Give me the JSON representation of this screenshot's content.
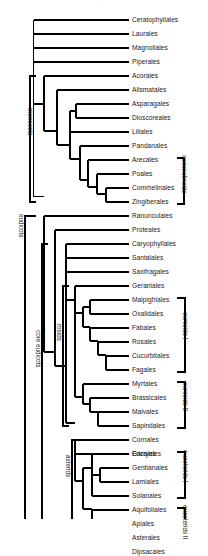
{
  "figure": {
    "type": "cladogram",
    "top_partial_caption": "· · · ·"
  },
  "tips": [
    {
      "name": "Ceratophyllales"
    },
    {
      "name": "Laurales"
    },
    {
      "name": "Magnoliales"
    },
    {
      "name": "Piperales"
    },
    {
      "name": "Acorales"
    },
    {
      "name": "Alismatales"
    },
    {
      "name": "Asparagales"
    },
    {
      "name": "Dioscoreales"
    },
    {
      "name": "Liliales"
    },
    {
      "name": "Pandanales"
    },
    {
      "name": "Arecales"
    },
    {
      "name": "Poales"
    },
    {
      "name": "Commelinales"
    },
    {
      "name": "Zingiberales"
    },
    {
      "name": "Ranunculales"
    },
    {
      "name": "Proteales"
    },
    {
      "name": "Caryophyllales"
    },
    {
      "name": "Santalales"
    },
    {
      "name": "Saxifragales"
    },
    {
      "name": "Geraniales"
    },
    {
      "name": "Malpighiales"
    },
    {
      "name": "Oxalidales"
    },
    {
      "name": "Fabales"
    },
    {
      "name": "Rosales"
    },
    {
      "name": "Cucurbitales"
    },
    {
      "name": "Fagales"
    },
    {
      "name": "Myrtales"
    },
    {
      "name": "Brassicales"
    },
    {
      "name": "Malvales"
    },
    {
      "name": "Sapindales"
    },
    {
      "name": "Cornales"
    },
    {
      "name": "Ericales"
    },
    {
      "name": "Garryales"
    },
    {
      "name": "Gentianales"
    },
    {
      "name": "Lamiales"
    },
    {
      "name": "Solanales"
    },
    {
      "name": "Aquifoliales"
    },
    {
      "name": "Apiales"
    },
    {
      "name": "Asterales"
    },
    {
      "name": "Dipsacales"
    }
  ],
  "clade_labels_left": [
    {
      "name": "monocots"
    },
    {
      "name": "eudicots"
    },
    {
      "name": "core eudicots"
    },
    {
      "name": "rosids"
    },
    {
      "name": "asterids"
    }
  ],
  "brackets_right": [
    {
      "name": "commelinoids"
    },
    {
      "name": "eurosids I"
    },
    {
      "name": "eurosids II"
    },
    {
      "name": "euasterids I"
    },
    {
      "name": "euasterids II"
    }
  ],
  "colors": {
    "line": "#000000",
    "text": "#1a1a1a",
    "background": "#ffffff"
  }
}
